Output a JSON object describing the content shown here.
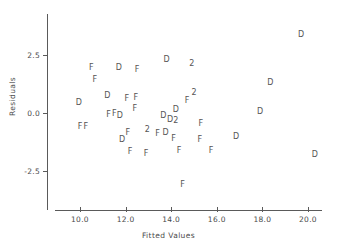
{
  "chart_data": {
    "type": "scatter",
    "title": "",
    "xlabel": "Fitted Values",
    "ylabel": "Residuals",
    "xlim": [
      8.9,
      21.3
    ],
    "ylim": [
      -4.2,
      3.9
    ],
    "xticks": [
      "10.0",
      "12.0",
      "14.0",
      "16.0",
      "18.0",
      "20.0"
    ],
    "xtick_values": [
      10.0,
      12.0,
      14.0,
      16.0,
      18.0,
      20.0
    ],
    "yticks": [
      "2.5",
      "0.0",
      "-2.5"
    ],
    "ytick_values": [
      2.5,
      0.0,
      -2.5
    ],
    "grid": false,
    "legend": "none",
    "marker_note": "Marker glyph encodes group: D, F, or 2 for two overplotted points",
    "points": [
      {
        "label": "D",
        "x": 19.7,
        "y": 3.35
      },
      {
        "label": "D",
        "x": 13.8,
        "y": 2.28
      },
      {
        "label": "2",
        "x": 14.9,
        "y": 2.1
      },
      {
        "label": "F",
        "x": 10.5,
        "y": 1.92
      },
      {
        "label": "D",
        "x": 11.7,
        "y": 1.92
      },
      {
        "label": "F",
        "x": 12.5,
        "y": 1.85
      },
      {
        "label": "F",
        "x": 10.65,
        "y": 1.42
      },
      {
        "label": "D",
        "x": 18.35,
        "y": 1.3
      },
      {
        "label": "2",
        "x": 15.0,
        "y": 0.85
      },
      {
        "label": "D",
        "x": 11.2,
        "y": 0.75
      },
      {
        "label": "F",
        "x": 12.05,
        "y": 0.62
      },
      {
        "label": "F",
        "x": 12.45,
        "y": 0.65
      },
      {
        "label": "F",
        "x": 14.7,
        "y": 0.5
      },
      {
        "label": "D",
        "x": 9.95,
        "y": 0.45
      },
      {
        "label": "F",
        "x": 12.4,
        "y": 0.18
      },
      {
        "label": "D",
        "x": 14.2,
        "y": 0.12
      },
      {
        "label": "D",
        "x": 17.9,
        "y": 0.05
      },
      {
        "label": "F",
        "x": 11.25,
        "y": -0.1
      },
      {
        "label": "F",
        "x": 11.5,
        "y": -0.05
      },
      {
        "label": "D",
        "x": 11.75,
        "y": -0.15
      },
      {
        "label": "D",
        "x": 13.65,
        "y": -0.12
      },
      {
        "label": "D",
        "x": 13.95,
        "y": -0.3
      },
      {
        "label": "2",
        "x": 14.2,
        "y": -0.35
      },
      {
        "label": "F",
        "x": 15.3,
        "y": -0.48
      },
      {
        "label": "F",
        "x": 10.0,
        "y": -0.6
      },
      {
        "label": "F",
        "x": 10.25,
        "y": -0.6
      },
      {
        "label": "2",
        "x": 12.95,
        "y": -0.72
      },
      {
        "label": "F",
        "x": 12.1,
        "y": -0.85
      },
      {
        "label": "F",
        "x": 13.4,
        "y": -0.9
      },
      {
        "label": "D",
        "x": 13.75,
        "y": -0.85
      },
      {
        "label": "D",
        "x": 16.85,
        "y": -1.05
      },
      {
        "label": "D",
        "x": 11.85,
        "y": -1.15
      },
      {
        "label": "F",
        "x": 14.1,
        "y": -1.1
      },
      {
        "label": "F",
        "x": 15.25,
        "y": -1.15
      },
      {
        "label": "F",
        "x": 12.2,
        "y": -1.68
      },
      {
        "label": "F",
        "x": 12.9,
        "y": -1.75
      },
      {
        "label": "F",
        "x": 14.35,
        "y": -1.65
      },
      {
        "label": "F",
        "x": 15.75,
        "y": -1.65
      },
      {
        "label": "D",
        "x": 20.3,
        "y": -1.8
      },
      {
        "label": "F",
        "x": 14.5,
        "y": -3.1
      }
    ]
  },
  "axes": {
    "x_title": "Fitted Values",
    "y_title": "Residuals"
  }
}
